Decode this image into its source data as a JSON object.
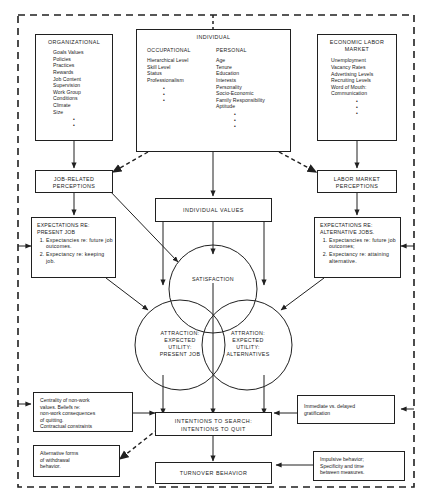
{
  "diagram": {
    "boxes": {
      "organizational": {
        "title": "ORGANIZATIONAL",
        "items": "Goals Values\nPolicies\nPractices\nRewards\nJob Content\nSupervision\nWork Group\nConditions\nClimate\nSize"
      },
      "individual": {
        "title": "INDIVIDUAL",
        "occupational_title": "OCCUPATIONAL",
        "occupational_items": "Hierarchical Level\nSkill Level\nStatus\nProfessionalism",
        "personal_title": "PERSONAL",
        "personal_items": "Age\nTenure\nEducation\nInterests\nPersonality\nSocio-Economic\nFamily Responsibility\nAptitude"
      },
      "economic": {
        "title": "ECONOMIC LABOR\nMARKET",
        "items": "Unemployment\nVacancy Rates\nAdvertising Levels\nRecruiting Levels\nWord of Mouth:\n  Communication"
      },
      "job_related_perceptions": {
        "title": "JOB-RELATED\nPERCEPTIONS"
      },
      "labor_market_perceptions": {
        "title": "LABOR MARKET\nPERCEPTIONS"
      },
      "expectations_present": {
        "heading": "EXPECTATIONS RE:\nPRESENT JOB",
        "item1": "Expectancies re: future job outcomes.",
        "item2": "Expectancy re: keeping job."
      },
      "expectations_alternative": {
        "heading": "EXPECTATIONS RE:\nALTERNATIVE JOBS.",
        "item1": "Expectancies re: future job outcomes;",
        "item2": "Expectancy re: attaining alternative."
      },
      "individual_values": {
        "title": "INDIVIDUAL VALUES"
      },
      "nonwork_values": {
        "text": "Centrality of non-work\nvalues. Beliefs re:\nnon-work consequences\nof quitting.\nContractual constraints"
      },
      "withdrawal": {
        "text": "Alternative forms\nof withdrawal\nbehavior."
      },
      "gratification": {
        "text": "Immediate vs. delayed\ngratification"
      },
      "impulsive": {
        "text": "Impulsive behavior;\nSpecificity and time\nbetween measures."
      },
      "intentions": {
        "title": "INTENTIONS TO SEARCH:\nINTENTIONS TO QUIT"
      },
      "turnover": {
        "title": "TURNOVER BEHAVIOR"
      }
    },
    "circles": {
      "satisfaction": {
        "label": "SATISFACTION"
      },
      "attraction_present": {
        "label": "ATTRACTION:\nEXPECTED\nUTILITY:\nPRESENT JOB"
      },
      "attraction_alternatives": {
        "label": "ATTRATION:\nEXPECTED\nUTILITY:\nALTERNATIVES"
      }
    },
    "dots_marker": "•",
    "colors": {
      "line": "#202020",
      "background": "#ffffff",
      "text": "#1a1a1a"
    }
  }
}
